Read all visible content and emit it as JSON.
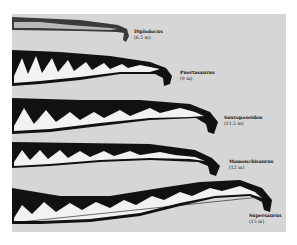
{
  "figure": {
    "background": "#d6d6d6",
    "neck_fill": "#111111",
    "vertebra_fill": "#f2f2f2"
  },
  "necks": [
    {
      "genus": "Diplodocus",
      "length": "(6.2 m)"
    },
    {
      "genus": "Puertasaurus",
      "length": "(9 m)"
    },
    {
      "genus": "Sauroposeidon",
      "length": "(11.5 m)"
    },
    {
      "genus": "Mamenchisaurus",
      "length": "(12 m)"
    },
    {
      "genus": "Supersaurus",
      "length": "(15 m)"
    }
  ]
}
